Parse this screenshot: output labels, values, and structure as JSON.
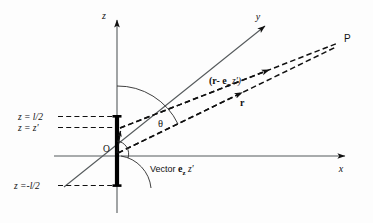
{
  "figure": {
    "kind": "physics-vector-diagram",
    "background_color": "#fdfdfd",
    "ink_color": "#111111",
    "axis_color": "#555a5c",
    "axes": [
      {
        "name": "z",
        "label": "z",
        "direction": "up"
      },
      {
        "name": "y",
        "label": "y",
        "direction": "up-right-oblique"
      },
      {
        "name": "x",
        "label": "x",
        "direction": "right"
      }
    ],
    "origin_label": "O",
    "field_point_label": "P",
    "angle_label": "θ",
    "source_labels": {
      "top": "z = l/2",
      "mid": "z = z'",
      "bottom": "z =-l/2"
    },
    "vector_labels": {
      "displacement": "(r- e",
      "displacement_sub": "z",
      "displacement_tail": " z')",
      "position": "r",
      "source_vector_prefix": "Vector ",
      "source_vector_symbol": "e",
      "source_vector_sub": "z",
      "source_vector_tail": " z'"
    }
  }
}
